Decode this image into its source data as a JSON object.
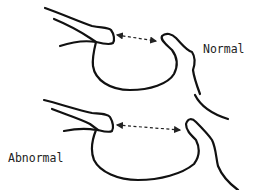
{
  "diagram": {
    "panels": [
      {
        "id": "normal",
        "label": "Normal"
      },
      {
        "id": "abnormal",
        "label": "Abnormal"
      }
    ],
    "annotation": "double-headed-dashed-arrow",
    "colors": {
      "line": "#111111",
      "background": "#ffffff"
    }
  }
}
